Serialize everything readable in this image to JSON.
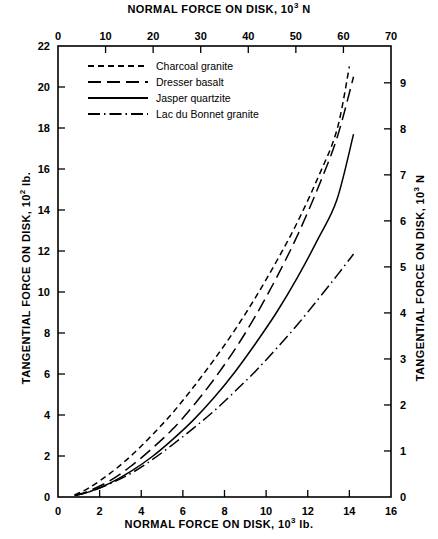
{
  "axes": {
    "top": {
      "title_main": "NORMAL FORCE ON DISK, 10",
      "title_exp": "3",
      "title_unit": " N"
    },
    "bottom": {
      "title_main": "NORMAL FORCE ON DISK, 10",
      "title_exp": "3",
      "title_unit": " lb."
    },
    "left": {
      "title_main": "TANGENTIAL FORCE ON DISK, 10",
      "title_exp": "2",
      "title_unit": " lb."
    },
    "right": {
      "title_main": "TANGENTIAL FORCE ON DISK, 10",
      "title_exp": "3",
      "title_unit": " N"
    }
  },
  "chart_data": {
    "type": "line",
    "title": "",
    "xlabel": "NORMAL FORCE ON DISK, 10^3 lb.",
    "ylabel": "TANGENTIAL FORCE ON DISK, 10^2 lb.",
    "xlabel_top": "NORMAL FORCE ON DISK, 10^3 N",
    "ylabel_right": "TANGENTIAL FORCE ON DISK, 10^3 N",
    "grid": false,
    "legend_position": "top-left",
    "xlim": [
      0,
      16
    ],
    "ylim": [
      0,
      22
    ],
    "xlim_top": [
      0,
      70
    ],
    "ylim_right": [
      0,
      9.8
    ],
    "xticks": [
      0,
      2,
      4,
      6,
      8,
      10,
      12,
      14,
      16
    ],
    "xticklabels": [
      "0",
      "2",
      "4",
      "6",
      "8",
      "10",
      "12",
      "14",
      "16"
    ],
    "yticks": [
      0,
      2,
      4,
      6,
      8,
      10,
      12,
      14,
      16,
      18,
      20,
      22
    ],
    "yticklabels": [
      "0",
      "2",
      "4",
      "6",
      "8",
      "10",
      "12",
      "14",
      "16",
      "18",
      "20",
      "22"
    ],
    "xticks_top": [
      0,
      10,
      20,
      30,
      40,
      50,
      60,
      70
    ],
    "xticklabels_top": [
      "0",
      "10",
      "20",
      "30",
      "40",
      "50",
      "60",
      "70"
    ],
    "yticks_right": [
      0,
      1,
      2,
      3,
      4,
      5,
      6,
      7,
      8,
      9
    ],
    "yticklabels_right": [
      "0",
      "1",
      "2",
      "3",
      "4",
      "5",
      "6",
      "7",
      "8",
      "9"
    ],
    "series": [
      {
        "name": "Charcoal granite",
        "style": "dashed-short",
        "x": [
          0.8,
          1.5,
          2.5,
          3.5,
          4.5,
          5.5,
          6.5,
          7.5,
          8.5,
          9.5,
          10.5,
          11.5,
          12.5,
          13.4,
          14.0
        ],
        "values": [
          0.1,
          0.45,
          1.15,
          2.0,
          3.0,
          4.1,
          5.35,
          6.7,
          8.15,
          9.75,
          11.5,
          13.4,
          15.6,
          17.9,
          21.0
        ]
      },
      {
        "name": "Dresser basalt",
        "style": "dashed-long",
        "x": [
          0.8,
          1.5,
          2.5,
          3.5,
          4.5,
          5.5,
          6.5,
          7.5,
          8.5,
          9.5,
          10.5,
          11.5,
          12.5,
          13.4,
          14.2
        ],
        "values": [
          0.08,
          0.3,
          0.8,
          1.5,
          2.35,
          3.3,
          4.45,
          5.75,
          7.2,
          8.85,
          10.7,
          12.75,
          15.1,
          17.5,
          20.5
        ]
      },
      {
        "name": "Jasper quartzite",
        "style": "solid",
        "x": [
          0.8,
          1.5,
          2.5,
          3.5,
          4.5,
          5.5,
          6.5,
          7.5,
          8.5,
          9.5,
          10.5,
          11.5,
          12.5,
          13.4,
          14.2
        ],
        "values": [
          0.07,
          0.25,
          0.68,
          1.25,
          1.95,
          2.8,
          3.75,
          4.85,
          6.1,
          7.5,
          9.0,
          10.7,
          12.6,
          14.5,
          17.7
        ]
      },
      {
        "name": "Lac du Bonnet granite",
        "style": "dash-dot",
        "x": [
          0.8,
          1.5,
          2.5,
          3.5,
          4.5,
          5.5,
          6.5,
          7.5,
          8.5,
          9.5,
          10.5,
          11.5,
          12.5,
          13.4,
          14.2
        ],
        "values": [
          0.07,
          0.25,
          0.65,
          1.15,
          1.8,
          2.55,
          3.35,
          4.2,
          5.15,
          6.15,
          7.25,
          8.4,
          9.65,
          10.8,
          11.85
        ]
      }
    ]
  },
  "legend": {
    "items": [
      {
        "label": "Charcoal granite",
        "style": "dashed-short"
      },
      {
        "label": "Dresser basalt",
        "style": "dashed-long"
      },
      {
        "label": "Jasper quartzite",
        "style": "solid"
      },
      {
        "label": "Lac du Bonnet granite",
        "style": "dash-dot"
      }
    ]
  }
}
